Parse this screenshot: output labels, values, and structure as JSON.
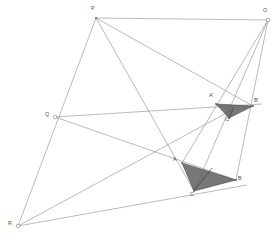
{
  "figure": {
    "width": 278,
    "height": 237,
    "background_color": "#ffffff",
    "line_color": "#8c8c8c",
    "triangle_fill_color": "#595959",
    "label_color": "#4f4f4f"
  },
  "points": {
    "P": {
      "label": "P",
      "x": 96,
      "y": 18,
      "label_x": 91,
      "label_y": 6,
      "marker": "dot"
    },
    "O": {
      "label": "O",
      "x": 268,
      "y": 20,
      "label_x": 263,
      "label_y": 8,
      "marker": "ring"
    },
    "Q": {
      "label": "Q",
      "x": 55,
      "y": 117,
      "label_x": 45,
      "label_y": 112,
      "marker": "ring"
    },
    "R": {
      "label": "R",
      "x": 18,
      "y": 226,
      "label_x": 8,
      "label_y": 221,
      "marker": "ring"
    },
    "A": {
      "label": "A",
      "x": 182,
      "y": 163,
      "label_x": 173,
      "label_y": 158,
      "marker": "dot"
    },
    "B": {
      "label": "B",
      "x": 236,
      "y": 180,
      "label_x": 238,
      "label_y": 176,
      "marker": "dot"
    },
    "C": {
      "label": "C",
      "x": 194,
      "y": 191,
      "label_x": 190,
      "label_y": 192,
      "marker": "dot"
    },
    "A1": {
      "label": "A'",
      "x": 216,
      "y": 104,
      "label_x": 209,
      "label_y": 94,
      "marker": "dot"
    },
    "B1": {
      "label": "B'",
      "x": 253,
      "y": 106,
      "label_x": 254,
      "label_y": 99,
      "marker": "dot"
    },
    "C1": {
      "label": "C'",
      "x": 229,
      "y": 118,
      "label_x": 225,
      "label_y": 116,
      "marker": "dot"
    }
  },
  "triangles": [
    {
      "name": "triangle-ABC",
      "vertices": [
        "A",
        "C",
        "B"
      ],
      "polygon": "182,163 194,191 236,180",
      "inner_line": {
        "from": "194,191",
        "to": "212,168"
      }
    },
    {
      "name": "triangle-A1B1C1",
      "vertices": [
        "A1",
        "C1",
        "B1"
      ],
      "polygon": "216,104 229,118 253,106",
      "inner_line": {
        "from": "229,118",
        "to": "234,107"
      }
    }
  ],
  "lines": [
    {
      "name": "line-O-A1-A",
      "from": "O",
      "to": "A",
      "d": "M 268,20 L 182,163"
    },
    {
      "name": "line-O-C1-C",
      "from": "O",
      "to": "C",
      "d": "M 268,20 L 194,191"
    },
    {
      "name": "line-O-B1-B",
      "from": "O",
      "to": "B",
      "d": "M 268,20 L 236,180"
    },
    {
      "name": "line-P-O",
      "from": "P",
      "to": "O",
      "d": "M 96,18 L 268,20"
    },
    {
      "name": "line-P-R",
      "from": "P",
      "to": "R",
      "d": "M 96,18 L 18,226"
    },
    {
      "name": "line-P-B1",
      "from": "P",
      "to": "B1",
      "d": "M 96,18 L 253,106"
    },
    {
      "name": "line-P-C",
      "from": "P",
      "to": "C",
      "d": "M 96,18 L 194,191"
    },
    {
      "name": "line-Q-B1",
      "from": "Q",
      "to": "B1",
      "d": "M 55,117 L 262,104"
    },
    {
      "name": "line-Q-B",
      "from": "Q",
      "to": "B",
      "d": "M 55,117 L 236,180"
    },
    {
      "name": "line-Q-R",
      "from": "Q",
      "to": "R",
      "d": "M 55,117 L 18,226"
    },
    {
      "name": "line-R-A1",
      "from": "R",
      "to": "A1",
      "d": "M 18,226 L 232,110"
    },
    {
      "name": "line-R-B",
      "from": "R",
      "to": "B",
      "d": "M 18,226 L 247,185"
    },
    {
      "name": "line-P-Q-seg",
      "from": "P",
      "to": "Q",
      "d": "M 96,18 L 55,117"
    }
  ]
}
